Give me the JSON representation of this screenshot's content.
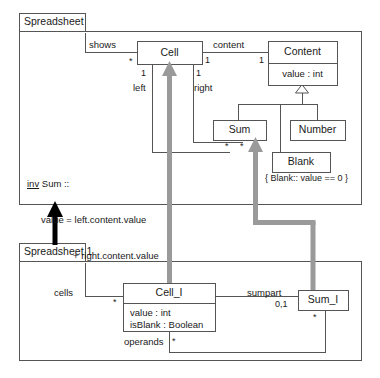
{
  "diagram": {
    "kind": "uml-class-diagram",
    "colors": {
      "stroke": "#555555",
      "text": "#1a1a1a",
      "refine_arrow_gray": "#9a9a9a",
      "refine_arrow_black": "#000000",
      "background": "#ffffff"
    },
    "packages": [
      {
        "id": "spreadsheet",
        "name": "Spreadsheet"
      },
      {
        "id": "spreadsheet1",
        "name": "Spreadsheet 1"
      }
    ],
    "classes": [
      {
        "id": "cell",
        "name": "Cell",
        "attributes": []
      },
      {
        "id": "content",
        "name": "Content",
        "attributes": [
          "value : int"
        ]
      },
      {
        "id": "sum",
        "name": "Sum",
        "attributes": []
      },
      {
        "id": "number",
        "name": "Number",
        "attributes": []
      },
      {
        "id": "blank",
        "name": "Blank",
        "attributes": []
      },
      {
        "id": "cell_i",
        "name": "Cell_I",
        "attributes": [
          "value : int",
          "isBlank : Boolean"
        ]
      },
      {
        "id": "sum_i",
        "name": "Sum_I",
        "attributes": []
      }
    ],
    "association_labels": {
      "shows": "shows",
      "content": "content",
      "left": "left",
      "right": "right",
      "cells": "cells",
      "sumpart": "sumpart",
      "operands": "operands"
    },
    "multiplicities": {
      "shows_cell_end": "*",
      "cell_content_end": "1",
      "content_end": "1",
      "left_end": "1",
      "right_end": "1",
      "sum_left_end": "*",
      "sum_right_end": "*",
      "cells_end": "*",
      "sumpart_end": "0,1",
      "sum_i_end": "*",
      "operands_end": "*"
    },
    "constraints": {
      "blank": "{ Blank:: value == 0 }"
    },
    "invariant": {
      "keyword": "inv",
      "head": " Sum ::",
      "line1": "value = left.content.value",
      "line2": "+ right.content.value"
    }
  }
}
